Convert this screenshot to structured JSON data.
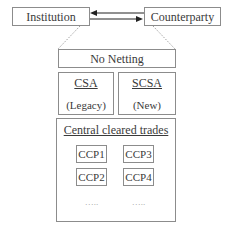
{
  "diagram": {
    "parties": {
      "institution": "Institution",
      "counterparty": "Counterparty"
    },
    "netting": {
      "no_netting": "No Netting"
    },
    "agreements": {
      "csa": {
        "title": "CSA",
        "subtitle": "(Legacy)"
      },
      "scsa": {
        "title": "SCSA",
        "subtitle": "(New)"
      }
    },
    "central_cleared": {
      "title": "Central cleared trades",
      "ccps": [
        "CCP1",
        "CCP2",
        "CCP3",
        "CCP4"
      ],
      "ellipsis_left": "…..",
      "ellipsis_right": "…..",
      "ccp_left_col": [
        "CCP1",
        "CCP2"
      ],
      "ccp_right_col": [
        "CCP3",
        "CCP4"
      ]
    },
    "colors": {
      "border": "#8c8c8c",
      "text": "#3a3a3a",
      "dotted_line": "#a0a0a0",
      "arrow": "#222222"
    }
  }
}
